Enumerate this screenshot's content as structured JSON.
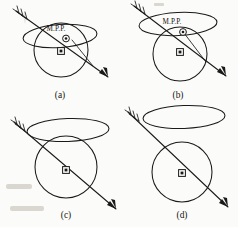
{
  "figure": {
    "caption_labels": [
      "(a)",
      "(b)",
      "(c)",
      "(d)"
    ],
    "mpp_text": "M.P.P.",
    "symbols": {
      "circled_dot": "circled-dot-symbol",
      "boxed_square": "boxed-square-symbol"
    },
    "colors": {
      "ink": "#1a1a1a",
      "paper": "#fbfbf9"
    },
    "panels": [
      {
        "id": "a",
        "label": "(a)",
        "mpp_label": "M.P.P.",
        "has_mpp_label": true,
        "has_circled_dot": true,
        "has_boxed_square": true,
        "has_secondary_ray": true,
        "relation": "ellipse intersects sphere through upper region",
        "circle": {
          "cx": 61,
          "cy": 50,
          "r": 27
        },
        "ellipse": {
          "cx": 60,
          "cy": 36,
          "rx": 37,
          "ry": 11.5,
          "rotate": -4
        },
        "arrow": {
          "x1": 16,
          "y1": 11,
          "x2": 108,
          "y2": 77
        },
        "secondary_ray": {
          "x1": 72,
          "y1": 40,
          "x2": 93,
          "y2": 66
        },
        "circled_dot": {
          "cx": 66,
          "cy": 38.5,
          "r": 3.4
        },
        "boxed_square": {
          "cx": 61,
          "cy": 51
        },
        "mpp_text_pos": {
          "x": 56,
          "y": 31
        },
        "label_pos": {
          "x": 60,
          "y": 98
        }
      },
      {
        "id": "b",
        "label": "(b)",
        "mpp_label": "M.P.P.",
        "has_mpp_label": true,
        "has_circled_dot": true,
        "has_boxed_square": true,
        "has_secondary_ray": true,
        "relation": "ellipse intersects sphere near top, tangent-ish",
        "circle": {
          "cx": 180,
          "cy": 54,
          "r": 27
        },
        "ellipse": {
          "cx": 178,
          "cy": 24,
          "rx": 39,
          "ry": 11.5,
          "rotate": -3
        },
        "arrow": {
          "x1": 134,
          "y1": 6,
          "x2": 226,
          "y2": 76
        },
        "secondary_ray": {
          "x1": 184,
          "y1": 33,
          "x2": 206,
          "y2": 62
        },
        "circled_dot": {
          "cx": 183,
          "cy": 32,
          "r": 3.4
        },
        "boxed_square": {
          "cx": 180,
          "cy": 52
        },
        "mpp_text_pos": {
          "x": 172,
          "y": 24
        },
        "label_pos": {
          "x": 178,
          "y": 98
        }
      },
      {
        "id": "c",
        "label": "(c)",
        "mpp_label": "",
        "has_mpp_label": false,
        "has_circled_dot": false,
        "has_boxed_square": true,
        "has_secondary_ray": false,
        "relation": "ellipse tangent above sphere",
        "circle": {
          "cx": 66,
          "cy": 167,
          "r": 31
        },
        "ellipse": {
          "cx": 68,
          "cy": 130,
          "rx": 41,
          "ry": 11.5,
          "rotate": -2
        },
        "arrow": {
          "x1": 14,
          "y1": 122,
          "x2": 116,
          "y2": 209
        },
        "boxed_square": {
          "cx": 66,
          "cy": 170
        },
        "label_pos": {
          "x": 66,
          "y": 218
        }
      },
      {
        "id": "d",
        "label": "(d)",
        "mpp_label": "",
        "has_mpp_label": false,
        "has_circled_dot": false,
        "has_boxed_square": true,
        "has_secondary_ray": false,
        "relation": "ellipse fully separated above sphere",
        "circle": {
          "cx": 182,
          "cy": 172,
          "r": 30
        },
        "ellipse": {
          "cx": 184,
          "cy": 117,
          "rx": 41,
          "ry": 11.5,
          "rotate": -2
        },
        "arrow": {
          "x1": 128,
          "y1": 112,
          "x2": 228,
          "y2": 207
        },
        "boxed_square": {
          "cx": 182,
          "cy": 172
        },
        "label_pos": {
          "x": 182,
          "y": 218
        }
      }
    ]
  }
}
